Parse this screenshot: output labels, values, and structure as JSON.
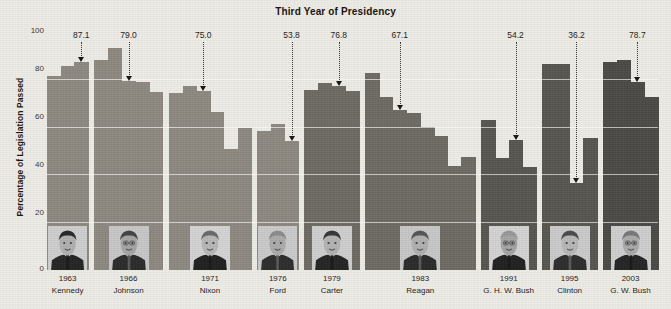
{
  "chart_title": "Third Year of Presidency",
  "y_axis": {
    "label": "Percentage of Legislation Passed",
    "ticks": [
      "0",
      "20",
      "40",
      "60",
      "80",
      "100"
    ]
  },
  "colors": {
    "background": "#edebe5",
    "bar": "#8c8880",
    "bar_dark": "#6d6a63",
    "bar_darker": "#575550",
    "bar_darkest": "#4b4945",
    "gridline": "#ffffff",
    "text": "#1d1915"
  },
  "x_labels": [
    {
      "year": "1963",
      "name": "Kennedy"
    },
    {
      "year": "1966",
      "name": "Johnson"
    },
    {
      "year": "1971",
      "name": "Nixon"
    },
    {
      "year": "1976",
      "name": "Ford"
    },
    {
      "year": "1979",
      "name": "Carter"
    },
    {
      "year": "1983",
      "name": "Reagan"
    },
    {
      "year": "1991",
      "name": "G. H. W. Bush"
    },
    {
      "year": "1995",
      "name": "Clinton"
    },
    {
      "year": "2003",
      "name": "G. W. Bush"
    }
  ],
  "callouts": [
    {
      "value": "87.1",
      "president": "Kennedy"
    },
    {
      "value": "79.0",
      "president": "Johnson"
    },
    {
      "value": "75.0",
      "president": "Nixon"
    },
    {
      "value": "53.8",
      "president": "Ford"
    },
    {
      "value": "76.8",
      "president": "Carter"
    },
    {
      "value": "67.1",
      "president": "Reagan"
    },
    {
      "value": "54.2",
      "president": "G. H. W. Bush"
    },
    {
      "value": "36.2",
      "president": "Clinton"
    },
    {
      "value": "78.7",
      "president": "G. W. Bush"
    }
  ],
  "chart_data": {
    "type": "bar",
    "title": "Third Year of Presidency",
    "xlabel": "",
    "ylabel": "Percentage of Legislation Passed",
    "ylim": [
      0,
      100
    ],
    "yticks": [
      0,
      20,
      40,
      60,
      80,
      100
    ],
    "grid": true,
    "legend": "none",
    "note": "Grayscale bar chart of presidential legislative success rate by year. Each president's third-year-in-office value is annotated with a dotted leader line and a downward arrow. Presidential portrait photographs are embedded along the bottom of each president's bar group.",
    "groups": [
      {
        "president": "Kennedy",
        "third_year": "1963",
        "third_year_value": 87.1,
        "years": [
          1961,
          1962,
          1963
        ],
        "values": [
          81.0,
          85.4,
          87.1
        ]
      },
      {
        "president": "Johnson",
        "third_year": "1966",
        "third_year_value": 79.0,
        "years": [
          1964,
          1965,
          1966,
          1967,
          1968
        ],
        "values": [
          88.0,
          93.0,
          79.0,
          78.8,
          74.5
        ]
      },
      {
        "president": "Nixon",
        "third_year": "1971",
        "third_year_value": 75.0,
        "years": [
          1969,
          1970,
          1971,
          1972,
          1973,
          1974
        ],
        "values": [
          74.0,
          77.0,
          75.0,
          66.0,
          50.6,
          59.6
        ]
      },
      {
        "president": "Ford",
        "third_year": "1976",
        "third_year_value": 53.8,
        "years": [
          1974,
          1975,
          1976
        ],
        "values": [
          58.2,
          61.0,
          53.8
        ]
      },
      {
        "president": "Carter",
        "third_year": "1979",
        "third_year_value": 76.8,
        "years": [
          1977,
          1978,
          1979,
          1980
        ],
        "values": [
          75.4,
          78.3,
          76.8,
          75.1
        ]
      },
      {
        "president": "Reagan",
        "third_year": "1983",
        "third_year_value": 67.1,
        "years": [
          1981,
          1982,
          1983,
          1984,
          1985,
          1986,
          1987,
          1988
        ],
        "values": [
          82.4,
          72.4,
          67.1,
          65.8,
          59.9,
          56.1,
          43.5,
          47.4
        ]
      },
      {
        "president": "G. H. W. Bush",
        "third_year": "1991",
        "third_year_value": 54.2,
        "years": [
          1989,
          1990,
          1991,
          1992
        ],
        "values": [
          62.6,
          46.8,
          54.2,
          43.0
        ]
      },
      {
        "president": "Clinton",
        "third_year": "1995",
        "third_year_value": 36.2,
        "years": [
          1993,
          1994,
          1995,
          1996
        ],
        "values": [
          86.4,
          86.4,
          36.2,
          55.1
        ]
      },
      {
        "president": "G. W. Bush",
        "third_year": "2003",
        "third_year_value": 78.7,
        "years": [
          2001,
          2002,
          2003,
          2004
        ],
        "values": [
          87.0,
          88.0,
          78.7,
          72.6
        ]
      }
    ]
  }
}
